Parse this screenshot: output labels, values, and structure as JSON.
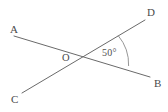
{
  "diagram": {
    "background_color": "#ffffff",
    "stroke_color": "#6a6a6a",
    "text_color": "#4a4a4a",
    "points": {
      "A": {
        "label": "A",
        "x": 14,
        "y": 36
      },
      "B": {
        "label": "B",
        "x": 150,
        "y": 77
      },
      "C": {
        "label": "C",
        "x": 22,
        "y": 93
      },
      "D": {
        "label": "D",
        "x": 145,
        "y": 20
      },
      "O": {
        "label": "O",
        "x": 82,
        "y": 57
      }
    },
    "lines": [
      {
        "name": "line-AB",
        "from": "A",
        "to": "B"
      },
      {
        "name": "line-CD",
        "from": "C",
        "to": "D"
      }
    ],
    "angle": {
      "label": "50°",
      "value": 50,
      "unit": "degrees",
      "vertex": "O",
      "ray_from": "D",
      "ray_to": "B"
    }
  }
}
